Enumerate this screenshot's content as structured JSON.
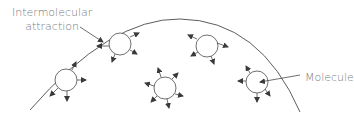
{
  "diagram": {
    "labels": {
      "attraction_line1": "Intermolecular",
      "attraction_line2": "attraction",
      "molecule": "Molecule"
    },
    "colors": {
      "line": "#4a4a4a",
      "text": "#7a7a7a",
      "background": "#ffffff"
    },
    "boundary": {
      "type": "arc",
      "description": "liquid surface"
    },
    "molecules": [
      {
        "id": "top-left",
        "cx": 120,
        "cy": 44,
        "r": 11,
        "arrows": [
          "upper-right",
          "right-down",
          "down-left",
          "upper-left",
          "left"
        ]
      },
      {
        "id": "left",
        "cx": 66,
        "cy": 80,
        "r": 11,
        "arrows": [
          "up-right",
          "right",
          "down",
          "down-left"
        ]
      },
      {
        "id": "center",
        "cx": 165,
        "cy": 88,
        "r": 11,
        "arrows": [
          "up",
          "up-right",
          "right",
          "down-right",
          "down",
          "down-left",
          "left"
        ]
      },
      {
        "id": "top-right",
        "cx": 207,
        "cy": 46,
        "r": 11,
        "arrows": [
          "upper-left",
          "down-left",
          "down",
          "right-down"
        ]
      },
      {
        "id": "right",
        "cx": 257,
        "cy": 82,
        "r": 11,
        "arrows": [
          "up-left",
          "left",
          "down",
          "down-right"
        ]
      }
    ]
  }
}
